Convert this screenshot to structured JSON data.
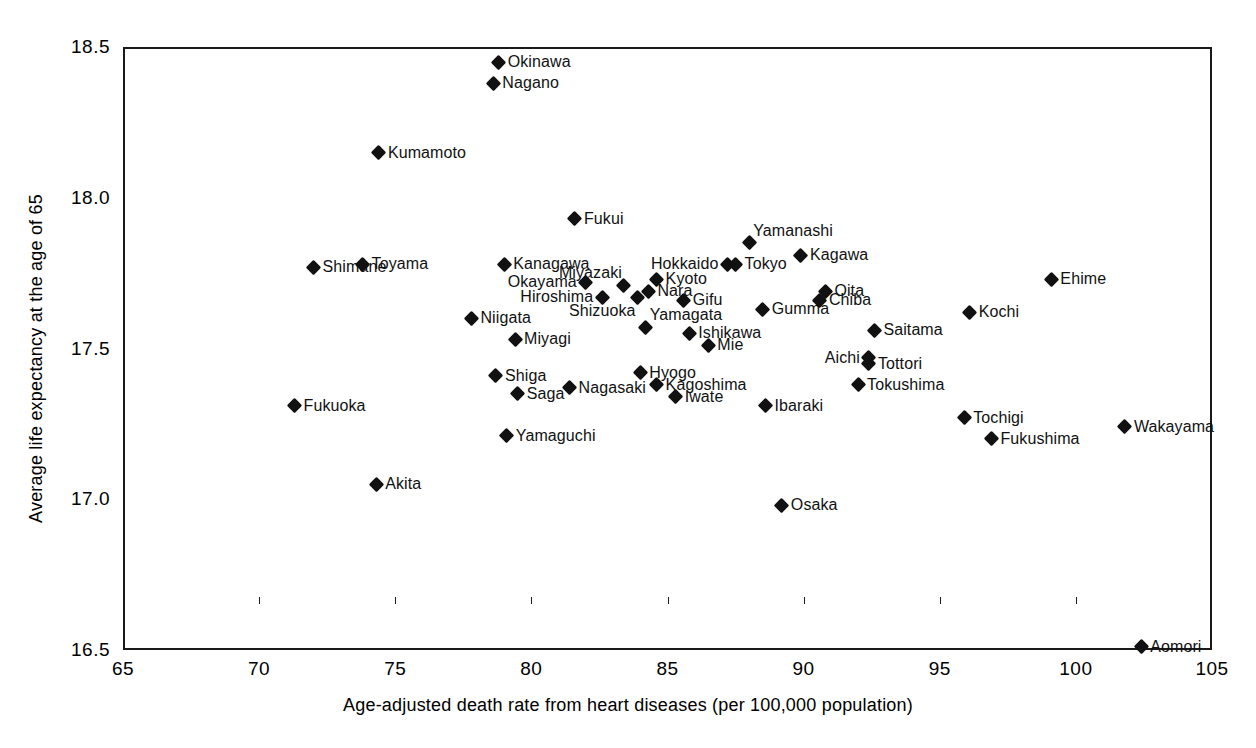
{
  "chart_data": {
    "type": "scatter",
    "title": "",
    "xlabel": "Age-adjusted death rate from heart diseases (per 100,000 population)",
    "ylabel": "Average life expectancy at the age of 65",
    "xlim": [
      65,
      105
    ],
    "ylim": [
      16.5,
      18.5
    ],
    "xticks": [
      65,
      70,
      75,
      80,
      85,
      90,
      95,
      100,
      105
    ],
    "yticks": [
      16.5,
      17.0,
      17.5,
      18.0,
      18.5
    ],
    "xtick_labels": [
      "65",
      "70",
      "75",
      "80",
      "85",
      "90",
      "95",
      "100",
      "105"
    ],
    "ytick_labels": [
      "16.5",
      "17.0",
      "17.5",
      "18.0",
      "18.5"
    ],
    "grid": false,
    "legend": null,
    "marker": "diamond",
    "marker_color": "#111111",
    "points": [
      {
        "label": "Okinawa",
        "x": 78.8,
        "y": 18.45,
        "pos": "right"
      },
      {
        "label": "Nagano",
        "x": 78.6,
        "y": 18.38,
        "pos": "right"
      },
      {
        "label": "Kumamoto",
        "x": 74.4,
        "y": 18.15,
        "pos": "right"
      },
      {
        "label": "Fukui",
        "x": 81.6,
        "y": 17.93,
        "pos": "right"
      },
      {
        "label": "Yamanashi",
        "x": 88.0,
        "y": 17.85,
        "pos": "above"
      },
      {
        "label": "Kagawa",
        "x": 89.9,
        "y": 17.81,
        "pos": "right"
      },
      {
        "label": "Toyama",
        "x": 73.8,
        "y": 17.78,
        "pos": "right"
      },
      {
        "label": "Shimane",
        "x": 72.0,
        "y": 17.77,
        "pos": "right"
      },
      {
        "label": "Ehime",
        "x": 99.1,
        "y": 17.73,
        "pos": "right"
      },
      {
        "label": "Kanagawa",
        "x": 79.0,
        "y": 17.78,
        "pos": "right"
      },
      {
        "label": "Hokkaido",
        "x": 87.2,
        "y": 17.78,
        "pos": "left"
      },
      {
        "label": "Tokyo",
        "x": 87.5,
        "y": 17.78,
        "pos": "right"
      },
      {
        "label": "Okayama",
        "x": 82.0,
        "y": 17.72,
        "pos": "left"
      },
      {
        "label": "Miyazaki",
        "x": 83.4,
        "y": 17.71,
        "pos": "above-left"
      },
      {
        "label": "Kyoto",
        "x": 84.6,
        "y": 17.73,
        "pos": "right"
      },
      {
        "label": "Nara",
        "x": 84.3,
        "y": 17.69,
        "pos": "right"
      },
      {
        "label": "Oita",
        "x": 90.8,
        "y": 17.69,
        "pos": "right"
      },
      {
        "label": "Chiba",
        "x": 90.6,
        "y": 17.66,
        "pos": "right"
      },
      {
        "label": "Hiroshima",
        "x": 82.6,
        "y": 17.67,
        "pos": "left"
      },
      {
        "label": "Shizuoka",
        "x": 83.9,
        "y": 17.67,
        "pos": "below-left"
      },
      {
        "label": "Gifu",
        "x": 85.6,
        "y": 17.66,
        "pos": "right"
      },
      {
        "label": "Kochi",
        "x": 96.1,
        "y": 17.62,
        "pos": "right"
      },
      {
        "label": "Gumma",
        "x": 88.5,
        "y": 17.63,
        "pos": "right"
      },
      {
        "label": "Niigata",
        "x": 77.8,
        "y": 17.6,
        "pos": "right"
      },
      {
        "label": "Yamagata",
        "x": 84.2,
        "y": 17.57,
        "pos": "above"
      },
      {
        "label": "Ishikawa",
        "x": 85.8,
        "y": 17.55,
        "pos": "right"
      },
      {
        "label": "Saitama",
        "x": 92.6,
        "y": 17.56,
        "pos": "right"
      },
      {
        "label": "Miyagi",
        "x": 79.4,
        "y": 17.53,
        "pos": "right"
      },
      {
        "label": "Mie",
        "x": 86.5,
        "y": 17.51,
        "pos": "right"
      },
      {
        "label": "Aichi",
        "x": 92.4,
        "y": 17.47,
        "pos": "left"
      },
      {
        "label": "Tottori",
        "x": 92.4,
        "y": 17.45,
        "pos": "right"
      },
      {
        "label": "Shiga",
        "x": 78.7,
        "y": 17.41,
        "pos": "right"
      },
      {
        "label": "Hyogo",
        "x": 84.0,
        "y": 17.42,
        "pos": "right"
      },
      {
        "label": "Tokushima",
        "x": 92.0,
        "y": 17.38,
        "pos": "right"
      },
      {
        "label": "Kagoshima",
        "x": 84.6,
        "y": 17.38,
        "pos": "right"
      },
      {
        "label": "Nagasaki",
        "x": 81.4,
        "y": 17.37,
        "pos": "right"
      },
      {
        "label": "Saga",
        "x": 79.5,
        "y": 17.35,
        "pos": "right"
      },
      {
        "label": "Iwate",
        "x": 85.3,
        "y": 17.34,
        "pos": "right"
      },
      {
        "label": "Fukuoka",
        "x": 71.3,
        "y": 17.31,
        "pos": "right"
      },
      {
        "label": "Ibaraki",
        "x": 88.6,
        "y": 17.31,
        "pos": "right"
      },
      {
        "label": "Tochigi",
        "x": 95.9,
        "y": 17.27,
        "pos": "right"
      },
      {
        "label": "Wakayama",
        "x": 101.8,
        "y": 17.24,
        "pos": "right"
      },
      {
        "label": "Yamaguchi",
        "x": 79.1,
        "y": 17.21,
        "pos": "right"
      },
      {
        "label": "Fukushima",
        "x": 96.9,
        "y": 17.2,
        "pos": "right"
      },
      {
        "label": "Akita",
        "x": 74.3,
        "y": 17.05,
        "pos": "right"
      },
      {
        "label": "Osaka",
        "x": 89.2,
        "y": 16.98,
        "pos": "right"
      },
      {
        "label": "Aomori",
        "x": 102.4,
        "y": 16.51,
        "pos": "right"
      }
    ]
  }
}
